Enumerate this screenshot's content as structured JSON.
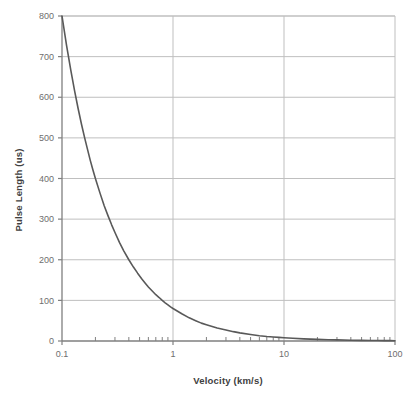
{
  "chart_data": {
    "type": "line",
    "title": "",
    "xlabel": "Velocity (km/s)",
    "ylabel": "Pulse Length (us)",
    "xscale": "log",
    "yscale": "linear",
    "xlim": [
      0.1,
      100
    ],
    "ylim": [
      0,
      800
    ],
    "grid": "horizontal-and-major-vertical",
    "legend": "none",
    "xticks": [
      "0.1",
      "1",
      "10",
      "100"
    ],
    "xtick_values": [
      0.1,
      1,
      10,
      100
    ],
    "xminor_ticks": [
      0.2,
      0.3,
      0.4,
      0.5,
      0.6,
      0.7,
      0.8,
      0.9,
      2,
      3,
      4,
      5,
      6,
      7,
      8,
      9,
      20,
      30,
      40,
      50,
      60,
      70,
      80,
      90
    ],
    "yticks": [
      "0",
      "100",
      "200",
      "300",
      "400",
      "500",
      "600",
      "700",
      "800"
    ],
    "ytick_values": [
      0,
      100,
      200,
      300,
      400,
      500,
      600,
      700,
      800
    ],
    "series": [
      {
        "name": "Pulse Length",
        "color": "#595959",
        "x": [
          0.1,
          0.11,
          0.12,
          0.13,
          0.14,
          0.15,
          0.16,
          0.17,
          0.18,
          0.19,
          0.2,
          0.22,
          0.24,
          0.26,
          0.28,
          0.3,
          0.33,
          0.36,
          0.4,
          0.44,
          0.48,
          0.52,
          0.56,
          0.6,
          0.65,
          0.7,
          0.75,
          0.8,
          0.85,
          0.9,
          0.95,
          1,
          1.2,
          1.4,
          1.6,
          1.8,
          2,
          2.5,
          3,
          3.5,
          4,
          5,
          6,
          7,
          8,
          9,
          10,
          12,
          15,
          20,
          25,
          30,
          40,
          50,
          60,
          70,
          80,
          90,
          100
        ],
        "y": [
          800,
          727,
          667,
          615,
          571,
          533,
          500,
          471,
          444,
          421,
          400,
          364,
          333,
          308,
          286,
          267,
          242,
          222,
          200,
          182,
          167,
          154,
          143,
          133,
          123,
          114,
          107,
          100,
          94,
          89,
          84,
          80,
          67,
          57,
          50,
          44,
          40,
          32,
          27,
          23,
          20,
          16,
          13,
          11,
          10,
          8.9,
          8,
          6.7,
          5.3,
          4,
          3.2,
          2.7,
          2,
          1.6,
          1.3,
          1.1,
          1,
          0.9,
          0.8
        ]
      }
    ]
  },
  "chart": {
    "xlabel": "Velocity (km/s)",
    "ylabel": "Pulse Length (us)"
  }
}
